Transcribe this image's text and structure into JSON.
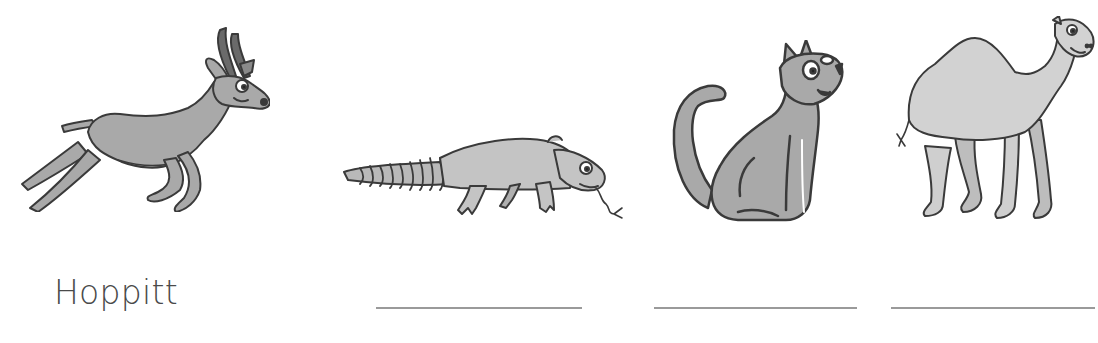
{
  "worksheet": {
    "items": [
      {
        "animal": "antelope",
        "label": "Hoppitt",
        "answered": true
      },
      {
        "animal": "lizard",
        "label": "",
        "answered": false
      },
      {
        "animal": "cat",
        "label": "",
        "answered": false
      },
      {
        "animal": "camel",
        "label": "",
        "answered": false
      }
    ]
  },
  "colors": {
    "fill": "#a9a9a9",
    "fill_light": "#d2d2d2",
    "outline": "#3a3a3a",
    "text": "#4a4a4a",
    "line": "#9a9a9a"
  }
}
